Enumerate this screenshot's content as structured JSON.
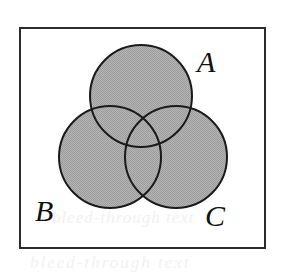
{
  "figure": {
    "kind": "venn-diagram",
    "frame": {
      "shape": "rectangle",
      "x": 19,
      "y": 27,
      "width": 247,
      "height": 222,
      "stroke_color": "#2b2b2b",
      "stroke_width": 2,
      "fill_color": "#ffffff"
    },
    "fill": {
      "circle_fill_color": "#a9a9a9",
      "circle_stroke_color": "#1a1a1a",
      "circle_stroke_width": 2,
      "pattern": "halftone-gray"
    },
    "sets": [
      {
        "label": "A",
        "name": "set-a",
        "position": "top",
        "cx": 141,
        "cy": 96,
        "r": 51,
        "label_x": 197,
        "label_y": 47
      },
      {
        "label": "B",
        "name": "set-b",
        "position": "bottom-left",
        "cx": 110,
        "cy": 157,
        "r": 51,
        "label_x": 35,
        "label_y": 196
      },
      {
        "label": "C",
        "name": "set-c",
        "position": "bottom-right",
        "cx": 176,
        "cy": 157,
        "r": 51,
        "label_x": 205,
        "label_y": 201
      }
    ],
    "regions": [
      "A only",
      "B only",
      "C only",
      "A and B",
      "A and C",
      "B and C",
      "A and B and C",
      "universe outside A, B and C"
    ],
    "shaded_description": "All three circles are shaded gray; the region of the rectangle outside the circles is white."
  },
  "artifacts": {
    "ghost_text_middle": "bleed-through text",
    "ghost_text_bottom": "bleed-through text"
  }
}
